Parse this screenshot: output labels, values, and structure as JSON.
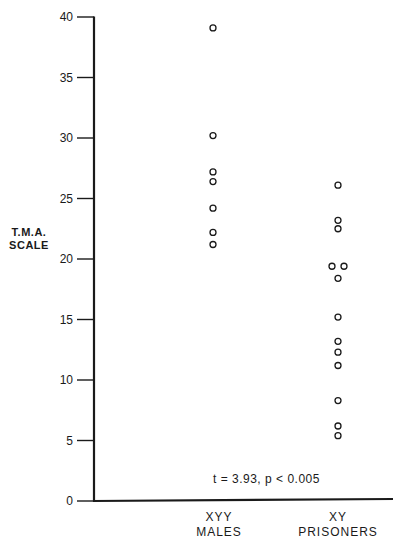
{
  "chart_data": {
    "type": "scatter",
    "title": "",
    "xlabel": "",
    "ylabel": "T.M.A. SCALE",
    "ylabel_lines": [
      "T.M.A.",
      "SCALE"
    ],
    "ylim": [
      0,
      40
    ],
    "yticks": [
      0,
      5,
      10,
      15,
      20,
      25,
      30,
      35,
      40
    ],
    "grid": false,
    "legend": null,
    "categories": [
      "XYY MALES",
      "XY PRISONERS"
    ],
    "category_label_lines": [
      [
        "XYY",
        "MALES"
      ],
      [
        "XY",
        "PRISONERS"
      ]
    ],
    "series": [
      {
        "name": "XYY MALES",
        "marker": "open-circle",
        "points": [
          {
            "x": 0,
            "y": 39.1
          },
          {
            "x": 0,
            "y": 30.2
          },
          {
            "x": 0,
            "y": 27.2
          },
          {
            "x": 0,
            "y": 26.4
          },
          {
            "x": 0,
            "y": 24.2
          },
          {
            "x": 0,
            "y": 22.2
          },
          {
            "x": 0,
            "y": 21.2
          }
        ]
      },
      {
        "name": "XY PRISONERS",
        "marker": "open-circle",
        "points": [
          {
            "x": 1,
            "y": 26.1
          },
          {
            "x": 1,
            "y": 23.2
          },
          {
            "x": 1,
            "y": 22.5
          },
          {
            "x": 1,
            "y": 19.4,
            "offset": -1
          },
          {
            "x": 1,
            "y": 19.4,
            "offset": 1
          },
          {
            "x": 1,
            "y": 18.4
          },
          {
            "x": 1,
            "y": 15.2
          },
          {
            "x": 1,
            "y": 13.2
          },
          {
            "x": 1,
            "y": 12.3
          },
          {
            "x": 1,
            "y": 11.2
          },
          {
            "x": 1,
            "y": 8.3
          },
          {
            "x": 1,
            "y": 6.2
          },
          {
            "x": 1,
            "y": 5.4
          }
        ]
      }
    ],
    "annotations": [
      {
        "text": "t = 3.93,  p < 0.005",
        "position": "bottom-center"
      }
    ]
  },
  "labels": {
    "ylabel_line1": "T.M.A.",
    "ylabel_line2": "SCALE",
    "cat0_line1": "XYY",
    "cat0_line2": "MALES",
    "cat1_line1": "XY",
    "cat1_line2": "PRISONERS",
    "annotation": "t = 3.93,  p < 0.005"
  },
  "colors": {
    "ink": "#1a1a1a",
    "background": "#ffffff"
  }
}
